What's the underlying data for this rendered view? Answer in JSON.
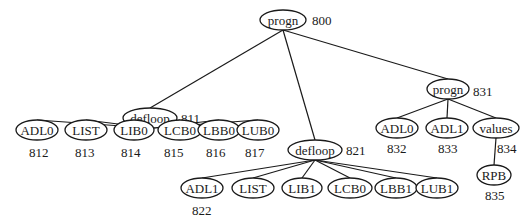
{
  "diagram": {
    "type": "tree",
    "nodes": [
      {
        "id": "n800",
        "label": "progn",
        "ref": "800",
        "cx": 283,
        "cy": 20,
        "rx": 23,
        "ry": 10,
        "ref_x": 312,
        "ref_y": 20
      },
      {
        "id": "n811",
        "label": "defloop",
        "ref": "811",
        "cx": 150,
        "cy": 118,
        "rx": 27,
        "ry": 10,
        "ref_x": 181,
        "ref_y": 118
      },
      {
        "id": "n812",
        "label": "ADL0",
        "ref": "812",
        "cx": 37,
        "cy": 130,
        "rx": 21,
        "ry": 10,
        "ref_x": 29,
        "ref_y": 152
      },
      {
        "id": "n813",
        "label": "LIST",
        "ref": "813",
        "cx": 86,
        "cy": 130,
        "rx": 21,
        "ry": 10,
        "ref_x": 75,
        "ref_y": 152
      },
      {
        "id": "n814",
        "label": "LIB0",
        "ref": "814",
        "cx": 134,
        "cy": 130,
        "rx": 20,
        "ry": 10,
        "ref_x": 121,
        "ref_y": 152
      },
      {
        "id": "n815",
        "label": "LCB0",
        "ref": "815",
        "cx": 180,
        "cy": 130,
        "rx": 22,
        "ry": 10,
        "ref_x": 164,
        "ref_y": 152
      },
      {
        "id": "n816",
        "label": "LBB0",
        "ref": "816",
        "cx": 219,
        "cy": 130,
        "rx": 21,
        "ry": 10,
        "ref_x": 206,
        "ref_y": 152
      },
      {
        "id": "n817",
        "label": "LUB0",
        "ref": "817",
        "cx": 258,
        "cy": 130,
        "rx": 21,
        "ry": 10,
        "ref_x": 245,
        "ref_y": 152
      },
      {
        "id": "n821",
        "label": "defloop",
        "ref": "821",
        "cx": 315,
        "cy": 150,
        "rx": 27,
        "ry": 10,
        "ref_x": 346,
        "ref_y": 150
      },
      {
        "id": "n822",
        "label": "ADL1",
        "ref": "822",
        "cx": 202,
        "cy": 188,
        "rx": 21,
        "ry": 10,
        "ref_x": 192,
        "ref_y": 210
      },
      {
        "id": "n823",
        "label": "LIST",
        "ref": "",
        "cx": 253,
        "cy": 188,
        "rx": 21,
        "ry": 10,
        "ref_x": 0,
        "ref_y": 0
      },
      {
        "id": "n824",
        "label": "LIB1",
        "ref": "",
        "cx": 302,
        "cy": 188,
        "rx": 20,
        "ry": 10,
        "ref_x": 0,
        "ref_y": 0
      },
      {
        "id": "n825",
        "label": "LCB0",
        "ref": "",
        "cx": 350,
        "cy": 188,
        "rx": 22,
        "ry": 10,
        "ref_x": 0,
        "ref_y": 0
      },
      {
        "id": "n826",
        "label": "LBB1",
        "ref": "",
        "cx": 396,
        "cy": 188,
        "rx": 21,
        "ry": 10,
        "ref_x": 0,
        "ref_y": 0
      },
      {
        "id": "n827",
        "label": "LUB1",
        "ref": "",
        "cx": 437,
        "cy": 188,
        "rx": 21,
        "ry": 10,
        "ref_x": 0,
        "ref_y": 0
      },
      {
        "id": "n831",
        "label": "progn",
        "ref": "831",
        "cx": 448,
        "cy": 89,
        "rx": 21,
        "ry": 10,
        "ref_x": 473,
        "ref_y": 91
      },
      {
        "id": "n832",
        "label": "ADL0",
        "ref": "832",
        "cx": 397,
        "cy": 128,
        "rx": 21,
        "ry": 10,
        "ref_x": 387,
        "ref_y": 148
      },
      {
        "id": "n833",
        "label": "ADL1",
        "ref": "833",
        "cx": 447,
        "cy": 128,
        "rx": 21,
        "ry": 10,
        "ref_x": 438,
        "ref_y": 148
      },
      {
        "id": "n834",
        "label": "values",
        "ref": "834",
        "cx": 496,
        "cy": 128,
        "rx": 23,
        "ry": 10,
        "ref_x": 497,
        "ref_y": 148
      },
      {
        "id": "n835",
        "label": "RPB",
        "ref": "835",
        "cx": 494,
        "cy": 175,
        "rx": 17,
        "ry": 10,
        "ref_x": 485,
        "ref_y": 195
      }
    ],
    "edges": [
      [
        "n800",
        "n811"
      ],
      [
        "n800",
        "n821"
      ],
      [
        "n800",
        "n831"
      ],
      [
        "n811",
        "n812"
      ],
      [
        "n811",
        "n813"
      ],
      [
        "n811",
        "n814"
      ],
      [
        "n811",
        "n815"
      ],
      [
        "n811",
        "n816"
      ],
      [
        "n811",
        "n817"
      ],
      [
        "n821",
        "n822"
      ],
      [
        "n821",
        "n823"
      ],
      [
        "n821",
        "n824"
      ],
      [
        "n821",
        "n825"
      ],
      [
        "n821",
        "n826"
      ],
      [
        "n821",
        "n827"
      ],
      [
        "n831",
        "n832"
      ],
      [
        "n831",
        "n833"
      ],
      [
        "n831",
        "n834"
      ],
      [
        "n834",
        "n835"
      ]
    ]
  }
}
